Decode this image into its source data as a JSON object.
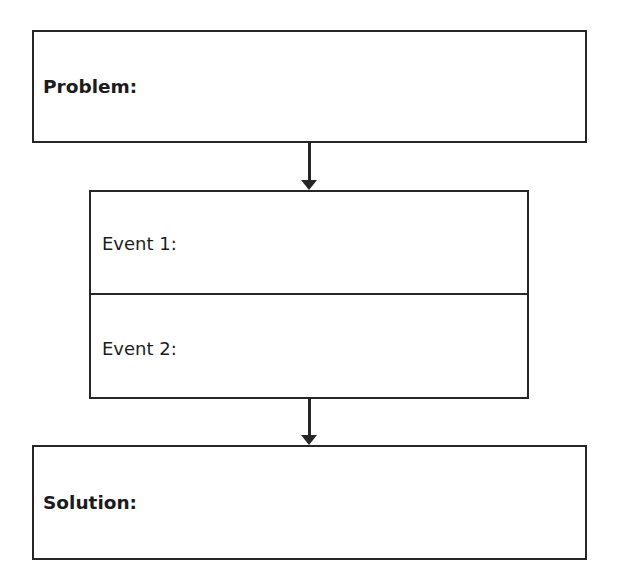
{
  "diagram": {
    "type": "flowchart",
    "problem": {
      "label": "Problem:"
    },
    "events": [
      {
        "label": "Event 1:"
      },
      {
        "label": "Event 2:"
      }
    ],
    "solution": {
      "label": "Solution:"
    },
    "colors": {
      "line": "#262626",
      "background": "#ffffff",
      "text": "#1c1c1c"
    }
  }
}
